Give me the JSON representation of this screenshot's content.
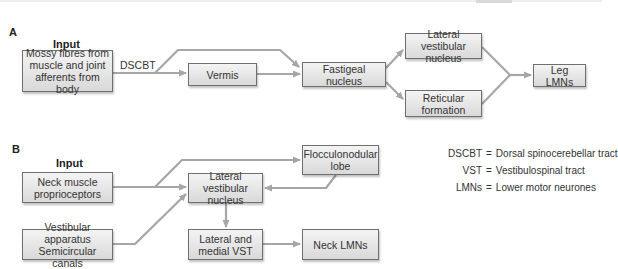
{
  "panels": {
    "a": {
      "label": "A",
      "input_label": "Input",
      "edge_label": "DSCBT",
      "boxes": {
        "mossy": "Mossy fibres from\nmuscle and joint\nafferents from body",
        "vermis": "Vermis",
        "fastigeal": "Fastigeal nucleus",
        "lateral_vestibular": "Lateral vestibular\nnucleus",
        "reticular": "Reticular\nformation",
        "leg_lmns": "Leg LMNs"
      }
    },
    "b": {
      "label": "B",
      "input_label": "Input",
      "boxes": {
        "neck_muscle": "Neck muscle\nproprioceptors",
        "vestibular_apparatus": "Vestibular apparatus\nSemicircular canals",
        "lateral_vestibular": "Lateral vestibular\nnucleus",
        "flocculonodular": "Flocculonodular\nlobe",
        "vst": "Lateral and\nmedial VST",
        "neck_lmns": "Neck LMNs"
      }
    }
  },
  "legend": [
    {
      "abbr": "DSCBT",
      "eq": "=",
      "meaning": "Dorsal spinocerebellar tract"
    },
    {
      "abbr": "VST",
      "eq": "=",
      "meaning": "Vestibulospinal tract"
    },
    {
      "abbr": "LMNs",
      "eq": "=",
      "meaning": "Lower motor neurones"
    }
  ],
  "colors": {
    "arrow": "#a6a6a6",
    "box_border": "#6f6f6f",
    "box_fill_top": "#f4f4f4",
    "box_fill_bottom": "#d9d9d9"
  }
}
